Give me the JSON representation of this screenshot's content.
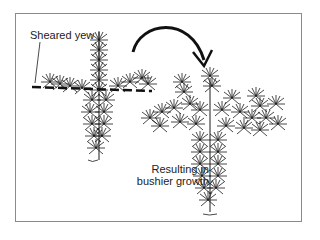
{
  "diagram": {
    "labels": {
      "sheared": "Sheared yew",
      "result_line1": "Resulting in",
      "result_line2": "bushier growth"
    },
    "colors": {
      "ink": "#1a1a1a",
      "frame": "#8a8a8a",
      "background": "#ffffff"
    }
  }
}
